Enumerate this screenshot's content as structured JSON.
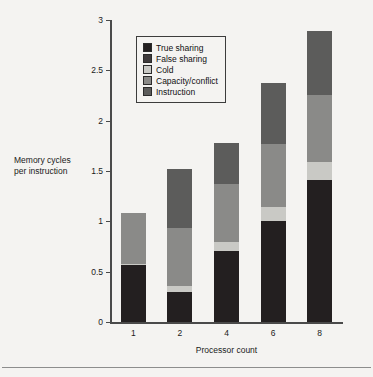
{
  "chart_data": {
    "type": "bar",
    "stacked": true,
    "title": "",
    "xlabel": "Processor count",
    "ylabel": "Memory cycles per instruction",
    "ylabel_lines": [
      "Memory cycles",
      "per instruction"
    ],
    "categories": [
      "1",
      "2",
      "4",
      "6",
      "8"
    ],
    "ylim": [
      0,
      3
    ],
    "ytick_labels": [
      "0",
      "0.5",
      "1",
      "1.5",
      "2",
      "2.5",
      "3"
    ],
    "ytick_values": [
      0,
      0.5,
      1,
      1.5,
      2,
      2.5,
      3
    ],
    "grid": false,
    "legend_position": "upper-left-inside",
    "series": [
      {
        "name": "True sharing",
        "color": "#231f20",
        "values": [
          0.57,
          0.3,
          0.71,
          1.0,
          1.41
        ]
      },
      {
        "name": "False sharing",
        "color": "#3f3b3c",
        "values": [
          0.0,
          0.0,
          0.0,
          0.0,
          0.0
        ]
      },
      {
        "name": "Cold",
        "color": "#c9c9c5",
        "values": [
          0.01,
          0.06,
          0.08,
          0.14,
          0.18
        ]
      },
      {
        "name": "Capacity/conflict",
        "color": "#8a8a88",
        "values": [
          0.5,
          0.57,
          0.58,
          0.63,
          0.67
        ]
      },
      {
        "name": "Instruction",
        "color": "#5c5c5b",
        "values": [
          0.0,
          0.59,
          0.41,
          0.6,
          0.63
        ]
      }
    ],
    "totals": [
      1.08,
      1.52,
      1.78,
      2.37,
      2.89
    ]
  },
  "legend": {
    "items": [
      {
        "label": "True sharing"
      },
      {
        "label": "False sharing"
      },
      {
        "label": "Cold"
      },
      {
        "label": "Capacity/conflict"
      },
      {
        "label": "Instruction"
      }
    ]
  }
}
